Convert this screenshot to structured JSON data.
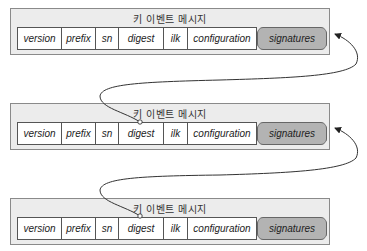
{
  "messages": [
    {
      "title": "키 이벤트 메시지",
      "fields": [
        "version",
        "prefix",
        "sn",
        "digest",
        "ilk",
        "configuration"
      ],
      "signatures": "signatures"
    },
    {
      "title": "키 이벤트 메시지",
      "fields": [
        "version",
        "prefix",
        "sn",
        "digest",
        "ilk",
        "configuration"
      ],
      "signatures": "signatures"
    },
    {
      "title": "키 이벤트 메시지",
      "fields": [
        "version",
        "prefix",
        "sn",
        "digest",
        "ilk",
        "configuration"
      ],
      "signatures": "signatures"
    }
  ],
  "colors": {
    "box_bg": "#ececec",
    "box_border": "#8a8a8a",
    "signatures_fill": "#b3b3b3",
    "arrow": "#222222"
  }
}
